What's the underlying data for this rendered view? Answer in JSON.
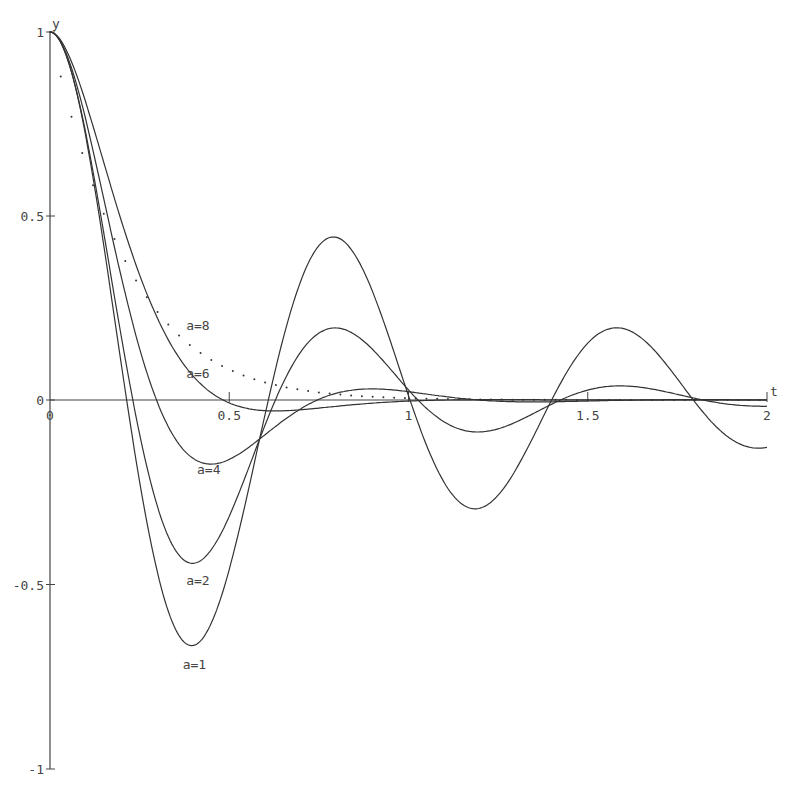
{
  "chart_data": {
    "type": "line",
    "title": "",
    "xlabel": "t",
    "ylabel": "y",
    "xlim": [
      0,
      2
    ],
    "ylim": [
      -1,
      1
    ],
    "grid": false,
    "legend_position": "inline labels",
    "x_ticks": [
      {
        "value": 0,
        "label": "0"
      },
      {
        "value": 0.5,
        "label": "0.5"
      },
      {
        "value": 1,
        "label": "1"
      },
      {
        "value": 1.5,
        "label": "1.5"
      },
      {
        "value": 2,
        "label": "2"
      }
    ],
    "y_ticks": [
      {
        "value": 1,
        "label": "1"
      },
      {
        "value": 0.5,
        "label": "0.5"
      },
      {
        "value": 0,
        "label": "0"
      },
      {
        "value": -0.5,
        "label": "-0.5"
      },
      {
        "value": -1,
        "label": "-1"
      }
    ],
    "series": [
      {
        "name": "a=1",
        "style": "solid",
        "sigma": 1.03,
        "omega": 7.95,
        "label_pos": [
          0.37,
          -0.73
        ],
        "key_points": [
          [
            0,
            1
          ],
          [
            0.39,
            -0.67
          ],
          [
            0.79,
            0.45
          ],
          [
            1.18,
            -0.31
          ],
          [
            1.57,
            0.2
          ],
          [
            2.0,
            -0.15
          ]
        ]
      },
      {
        "name": "a=2",
        "style": "solid",
        "sigma": 2.05,
        "omega": 7.9,
        "label_pos": [
          0.38,
          -0.5
        ],
        "key_points": [
          [
            0,
            1
          ],
          [
            0.4,
            -0.44
          ],
          [
            0.79,
            0.19
          ],
          [
            1.21,
            -0.09
          ],
          [
            1.62,
            0.03
          ],
          [
            2.0,
            -0.01
          ]
        ]
      },
      {
        "name": "a=4",
        "style": "solid",
        "sigma": 3.9,
        "omega": 7.0,
        "label_pos": [
          0.41,
          -0.2
        ],
        "key_points": [
          [
            0,
            1
          ],
          [
            0.45,
            -0.16
          ],
          [
            0.85,
            0.02
          ],
          [
            1.3,
            -0.003
          ],
          [
            2.0,
            0
          ]
        ]
      },
      {
        "name": "a=6",
        "style": "solid",
        "sigma": 5.6,
        "omega": 5.0,
        "label_pos": [
          0.38,
          0.06
        ],
        "key_points": [
          [
            0,
            1
          ],
          [
            0.5,
            -0.02
          ],
          [
            0.75,
            -0.02
          ],
          [
            1.2,
            -0.004
          ],
          [
            2.0,
            -0.02
          ]
        ]
      },
      {
        "name": "a=8",
        "style": "dotted",
        "sigma": 6.5,
        "omega": 0,
        "label_pos": [
          0.38,
          0.19
        ],
        "key_points": [
          [
            0,
            1
          ],
          [
            0.3,
            0.26
          ],
          [
            0.5,
            0.08
          ],
          [
            0.8,
            0.01
          ],
          [
            2.0,
            0
          ]
        ]
      }
    ]
  },
  "axes": {
    "x_label": "t",
    "y_label": "y"
  },
  "colors": {
    "line": "#333333",
    "axis": "#444444",
    "background": "#ffffff"
  }
}
